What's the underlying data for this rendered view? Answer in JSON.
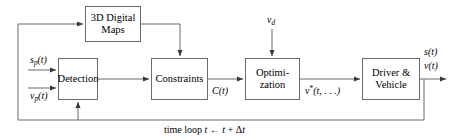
{
  "diagram": {
    "stroke_color": "#6a6a6a",
    "text_color": "#000000",
    "background": "#ffffff",
    "blocks": [
      {
        "id": "maps",
        "label_line1": "3D Digital",
        "label_line2": "Maps"
      },
      {
        "id": "detection",
        "label_line1": "Detection",
        "label_line2": ""
      },
      {
        "id": "constraints",
        "label_line1": "Constraints",
        "label_line2": ""
      },
      {
        "id": "optimization",
        "label_line1": "Optimi-",
        "label_line2": "zation"
      },
      {
        "id": "driver",
        "label_line1": "Driver &",
        "label_line2": "Vehicle"
      }
    ],
    "signals": {
      "input_sp": {
        "base": "s",
        "sub": "p",
        "arg": "(t)"
      },
      "input_vp": {
        "base": "v",
        "sub": "p",
        "arg": "(t)"
      },
      "desired_speed": {
        "base": "v",
        "sub": "d",
        "arg": ""
      },
      "constraints_out": {
        "base": "C",
        "sub": "",
        "arg": "(t)"
      },
      "optimal_speed": {
        "base": "v",
        "sup": "*",
        "arg": "(t, . . .)"
      },
      "output_s": {
        "base": "s",
        "arg": "(t)"
      },
      "output_v": {
        "base": "v",
        "arg": "(t)"
      }
    },
    "loop_label": {
      "prefix": "time loop ",
      "var1": "t",
      "arrow": " ← ",
      "var2": "t",
      "plus": " + ",
      "delta": "Δ",
      "var3": "t"
    }
  }
}
